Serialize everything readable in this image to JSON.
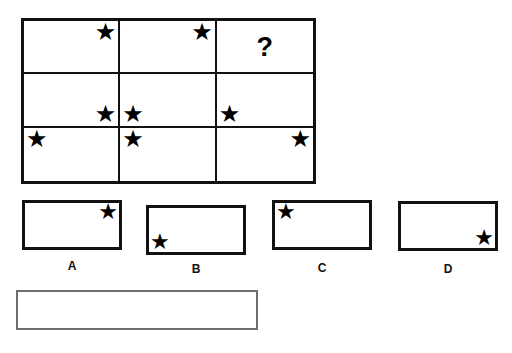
{
  "puzzle": {
    "type": "visual-analogy-matrix",
    "star_glyph": "★",
    "question_glyph": "?",
    "colors": {
      "ink": "#111111",
      "star": "#000000",
      "answer_box_border": "#6f6f6f",
      "background": "#ffffff"
    },
    "matrix": {
      "rows": 3,
      "columns": 3,
      "cells": [
        {
          "id": "r1c1",
          "content": "star",
          "position": "top-right"
        },
        {
          "id": "r1c2",
          "content": "star",
          "position": "top-right"
        },
        {
          "id": "r1c3",
          "content": "question",
          "position": "center"
        },
        {
          "id": "r2c1",
          "content": "star",
          "position": "bottom-right"
        },
        {
          "id": "r2c2",
          "content": "star",
          "position": "bottom-left"
        },
        {
          "id": "r2c3",
          "content": "star",
          "position": "bottom-left"
        },
        {
          "id": "r3c1",
          "content": "star",
          "position": "top-left"
        },
        {
          "id": "r3c2",
          "content": "star",
          "position": "top-left"
        },
        {
          "id": "r3c3",
          "content": "star",
          "position": "top-right"
        }
      ]
    },
    "options": [
      {
        "id": "A",
        "label": "A",
        "content": "star",
        "position": "top-right"
      },
      {
        "id": "B",
        "label": "B",
        "content": "star",
        "position": "bottom-left"
      },
      {
        "id": "C",
        "label": "C",
        "content": "star",
        "position": "top-left"
      },
      {
        "id": "D",
        "label": "D",
        "content": "star",
        "position": "bottom-right"
      }
    ],
    "answer_box": {
      "value": "",
      "placeholder": ""
    }
  }
}
